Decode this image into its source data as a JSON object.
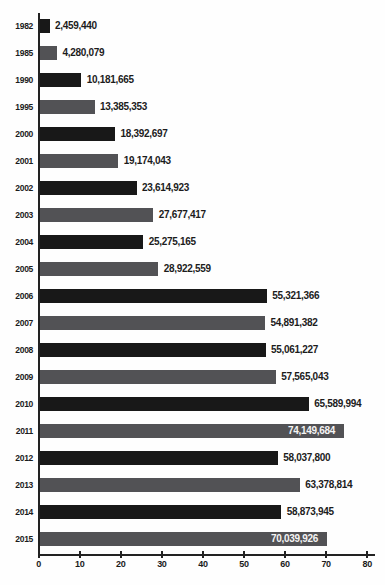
{
  "chart_data": {
    "type": "bar",
    "orientation": "horizontal",
    "title": "",
    "xlabel": "",
    "ylabel": "",
    "categories": [
      "1982",
      "1985",
      "1990",
      "1995",
      "2000",
      "2001",
      "2002",
      "2003",
      "2004",
      "2005",
      "2006",
      "2007",
      "2008",
      "2009",
      "2010",
      "2011",
      "2012",
      "2013",
      "2014",
      "2015"
    ],
    "values": [
      2459440,
      4280079,
      10181665,
      13385353,
      18392697,
      19174043,
      23614923,
      27677417,
      25275165,
      28922559,
      55321366,
      54891382,
      55061227,
      57565043,
      65589994,
      74149684,
      58037800,
      63378814,
      58873945,
      70039926
    ],
    "value_labels": [
      "2,459,440",
      "4,280,079",
      "10,181,665",
      "13,385,353",
      "18,392,697",
      "19,174,043",
      "23,614,923",
      "27,677,417",
      "25,275,165",
      "28,922,559",
      "55,321,366",
      "54,891,382",
      "55,061,227",
      "57,565,043",
      "65,589,994",
      "74,149,684",
      "58,037,800",
      "63,378,814",
      "58,873,945",
      "70,039,926"
    ],
    "label_inside_bar": [
      false,
      false,
      false,
      false,
      false,
      false,
      false,
      false,
      false,
      false,
      false,
      false,
      false,
      false,
      false,
      true,
      false,
      false,
      false,
      true
    ],
    "bar_color_pattern": [
      "#181818",
      "#525255"
    ],
    "xlim": [
      0,
      80
    ],
    "x_ticks": [
      "0",
      "10",
      "20",
      "30",
      "40",
      "50",
      "60",
      "70",
      "80"
    ],
    "axis_scale_divisor": 1000000,
    "grid": false,
    "legend": "none"
  },
  "colors": {
    "bar_black": "#181818",
    "bar_gray": "#525255",
    "axis": "#222222",
    "text": "#1b1b1b",
    "label_inside_text": "#f4f4f4",
    "background": "#fefefe"
  }
}
